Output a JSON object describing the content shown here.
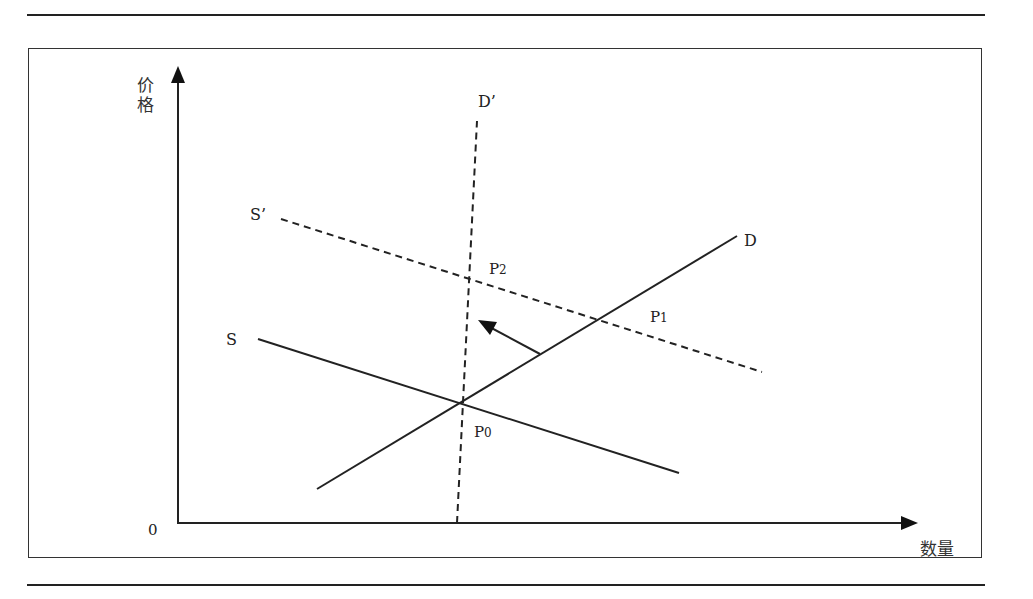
{
  "diagram": {
    "type": "supply-demand",
    "axes": {
      "y_label": [
        "价",
        "格"
      ],
      "x_label": "数量",
      "origin": "0"
    },
    "curves": [
      {
        "id": "S",
        "label": "S",
        "style": "solid"
      },
      {
        "id": "D",
        "label": "D",
        "style": "solid"
      },
      {
        "id": "S_prime",
        "label": "S’",
        "style": "dashed"
      },
      {
        "id": "D_prime",
        "label": "D’",
        "style": "dashed"
      }
    ],
    "points": [
      {
        "id": "P0",
        "main": "P",
        "sub": "0"
      },
      {
        "id": "P1",
        "main": "P",
        "sub": "1"
      },
      {
        "id": "P2",
        "main": "P",
        "sub": "2"
      }
    ],
    "colors": {
      "line": "#222222",
      "background": "#ffffff"
    }
  }
}
